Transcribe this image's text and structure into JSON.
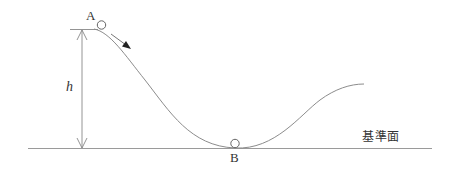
{
  "diagram": {
    "labels": {
      "point_a": "A",
      "point_b": "B",
      "height": "h",
      "reference_plane": "基準面"
    },
    "colors": {
      "line": "#888888",
      "text": "#333333",
      "arrow": "#222222"
    }
  }
}
